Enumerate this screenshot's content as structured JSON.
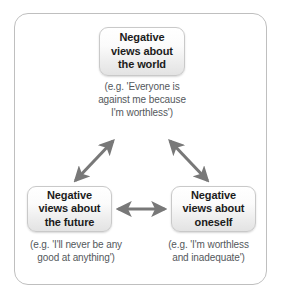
{
  "diagram": {
    "frame": {
      "name": "outer-frame"
    },
    "nodes": [
      {
        "id": "world",
        "label": "Negative views about the world",
        "line1": "Negative",
        "line2": "views about",
        "line3": "the world",
        "caption": "(e.g. 'Everyone is against me because I'm worthless')",
        "caption_line1": "(e.g. 'Everyone is",
        "caption_line2": "against me because",
        "caption_line3": "I'm worthless')"
      },
      {
        "id": "future",
        "label": "Negative views about the future",
        "line1": "Negative",
        "line2": "views about",
        "line3": "the future",
        "caption": "(e.g. 'I'll never be any good at anything')",
        "caption_line1": "(e.g. 'I'll never be any",
        "caption_line2": "good at anything')"
      },
      {
        "id": "oneself",
        "label": "Negative views about oneself",
        "line1": "Negative",
        "line2": "views about",
        "line3": "oneself",
        "caption": "(e.g. 'I'm worthless and inadequate')",
        "caption_line1": "(e.g. 'I'm worthless",
        "caption_line2": "and inadequate')"
      }
    ],
    "connectors": [
      {
        "id": "world-future",
        "from": "world",
        "to": "future",
        "style": "double-headed-arrow"
      },
      {
        "id": "world-oneself",
        "from": "world",
        "to": "oneself",
        "style": "double-headed-arrow"
      },
      {
        "id": "future-oneself",
        "from": "future",
        "to": "oneself",
        "style": "double-headed-arrow"
      }
    ],
    "colors": {
      "frame_border": "#bfbfbf",
      "node_border": "#c9c9c9",
      "node_fill_top": "#ffffff",
      "node_fill_bottom": "#e3e3e3",
      "node_text": "#1b1b1b",
      "caption_text": "#54585c",
      "arrow": "#787878",
      "background": "#ffffff"
    }
  }
}
